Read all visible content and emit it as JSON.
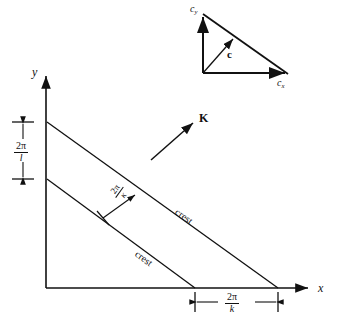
{
  "figure": {
    "axes": {
      "x_label": "x",
      "y_label": "y"
    },
    "crest_upper_label": "crest",
    "crest_lower_label": "crest",
    "wavenumber_label": "K",
    "perp_wavelength": {
      "numerator": "2π",
      "denominator": "κ"
    },
    "y_intercept_spacing": {
      "numerator": "2π",
      "denominator": "l"
    },
    "x_intercept_spacing": {
      "numerator": "2π",
      "denominator": "k"
    },
    "velocity_triangle": {
      "resultant_label": "c",
      "y_component_label": "c",
      "y_component_sub": "y",
      "x_component_label": "c",
      "x_component_sub": "x"
    },
    "colors": {
      "ink": "#111111",
      "background": "#ffffff"
    }
  }
}
